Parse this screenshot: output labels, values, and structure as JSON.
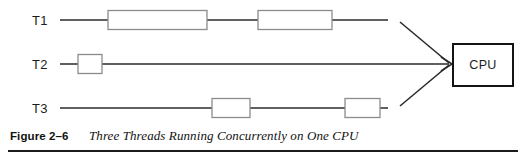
{
  "figure": {
    "caption_number": "Figure 2–6",
    "caption_title": "Three Threads Running Concurrently on One CPU",
    "colors": {
      "line": "#2b2b2b",
      "block_stroke": "#8c8c8c",
      "cpu_stroke": "#141414",
      "background": "#ffffff",
      "text": "#1a1a1a"
    }
  },
  "diagram": {
    "threads": [
      {
        "label": "T1",
        "label_x": 32,
        "label_y": 25,
        "track_y": 20,
        "line_start_x": 60,
        "line_end_x": 388,
        "blocks": [
          {
            "x": 108,
            "width": 99,
            "height": 19
          },
          {
            "x": 258,
            "width": 74,
            "height": 19
          }
        ]
      },
      {
        "label": "T2",
        "label_x": 32,
        "label_y": 69,
        "track_y": 64,
        "line_start_x": 60,
        "line_end_x": 388,
        "blocks": [
          {
            "x": 78,
            "width": 24,
            "height": 19
          }
        ]
      },
      {
        "label": "T3",
        "label_x": 32,
        "label_y": 113,
        "track_y": 108,
        "line_start_x": 60,
        "line_end_x": 388,
        "blocks": [
          {
            "x": 212,
            "width": 38,
            "height": 19
          },
          {
            "x": 345,
            "width": 35,
            "height": 19
          }
        ]
      }
    ],
    "converge_point": {
      "x": 450,
      "y": 64
    },
    "arrows": [
      {
        "name": "t1-to-cpu",
        "x1": 400,
        "y1": 22,
        "x2": 450,
        "y2": 64
      },
      {
        "name": "t2-to-cpu",
        "x1": 388,
        "y1": 64,
        "x2": 450,
        "y2": 64
      },
      {
        "name": "t3-to-cpu",
        "x1": 400,
        "y1": 106,
        "x2": 450,
        "y2": 64
      }
    ],
    "cpu": {
      "label": "CPU",
      "x": 453,
      "y": 44,
      "width": 60,
      "height": 42,
      "label_x": 483,
      "label_y": 69
    }
  }
}
